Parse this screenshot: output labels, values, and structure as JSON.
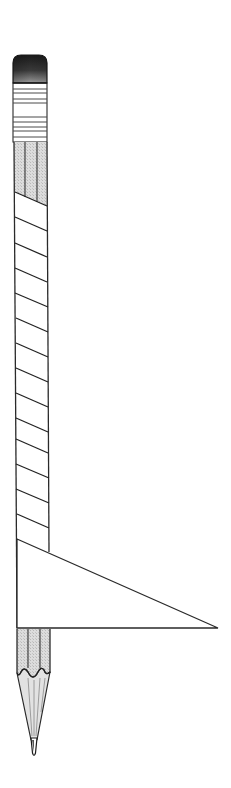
{
  "figure": {
    "colors": {
      "outline": "#2a2a2a",
      "eraser_dark": "#1e1e1e",
      "eraser_light": "#8a8a8a",
      "wood_fill": "#d4d4d4",
      "ferrule_fill": "#ffffff",
      "background": "#ffffff",
      "lead": "#333333"
    },
    "parts": {
      "eraser": {
        "x": 13,
        "y": 55,
        "width": 34,
        "height": 28
      },
      "ferrule": {
        "y_top": 83,
        "y_bottom": 142,
        "bands": [
          89,
          93,
          99,
          103,
          117,
          122,
          127,
          131,
          137
        ]
      },
      "upper_wood": {
        "y_top": 142,
        "stripes_x": [
          25,
          37
        ]
      },
      "diagonal_bands_left_y": [
        192,
        217,
        243,
        268,
        293,
        318,
        343,
        368,
        393,
        418,
        439,
        464,
        489,
        514
      ],
      "triangle": {
        "points": [
          [
            17,
            539
          ],
          [
            218,
            628
          ],
          [
            17,
            628
          ]
        ]
      },
      "lower_wood": {
        "y_top": 628,
        "y_scallop": 675,
        "stripes_x": [
          28,
          40
        ]
      },
      "tip": {
        "x": 34,
        "y": 756,
        "lead_start_y": 737
      }
    }
  }
}
